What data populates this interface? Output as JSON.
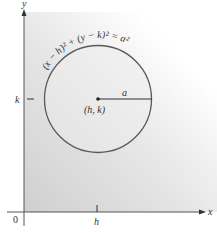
{
  "figure": {
    "axes": {
      "x_label": "x",
      "y_label": "y",
      "origin_label": "0",
      "x_tick_label": "h",
      "y_tick_label": "k"
    },
    "circle": {
      "equation": "(x − h)² + (y − k)² = a²",
      "center_label": "(h, k)",
      "radius_label": "a"
    },
    "colors": {
      "line": "#555555",
      "axis": "#333333",
      "shade_dark": "#d4d4d4",
      "shade_light": "#ffffff"
    }
  }
}
